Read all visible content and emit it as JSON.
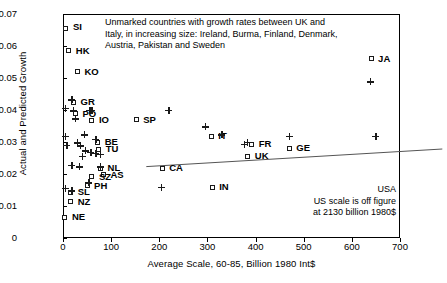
{
  "chart_data": {
    "type": "scatter",
    "title": "",
    "xlabel": "Average Scale, 60-85, Billion 1980 Int$",
    "ylabel": "Actual and Predicted Growth",
    "xlim": [
      0,
      700
    ],
    "ylim": [
      0,
      0.07
    ],
    "xticks": [
      "0",
      "100",
      "200",
      "300",
      "400",
      "500",
      "600",
      "700"
    ],
    "yticks": [
      "0",
      "0.01",
      "0.02",
      "0.03",
      "0.04",
      "0.05",
      "0.06",
      "0.07"
    ],
    "grid": false,
    "legend": "none",
    "series": [
      {
        "name": "Actual growth (open squares)",
        "marker": "open-square",
        "points": [
          {
            "label": "SI",
            "x": 6,
            "y": 0.0655
          },
          {
            "label": "HK",
            "x": 12,
            "y": 0.0585
          },
          {
            "label": "KO",
            "x": 30,
            "y": 0.052
          },
          {
            "label": "GR",
            "x": 22,
            "y": 0.0425
          },
          {
            "label": "PO",
            "x": 26,
            "y": 0.0388
          },
          {
            "label": "IO",
            "x": 60,
            "y": 0.0368
          },
          {
            "label": "SP",
            "x": 152,
            "y": 0.037
          },
          {
            "label": "BE",
            "x": 72,
            "y": 0.03
          },
          {
            "label": "TU",
            "x": 74,
            "y": 0.0278
          },
          {
            "label": "NL",
            "x": 78,
            "y": 0.0218
          },
          {
            "label": "AS",
            "x": 84,
            "y": 0.0198
          },
          {
            "label": "SZ",
            "x": 60,
            "y": 0.0192
          },
          {
            "label": "PH",
            "x": 50,
            "y": 0.0163
          },
          {
            "label": "SL",
            "x": 16,
            "y": 0.0143
          },
          {
            "label": "NZ",
            "x": 16,
            "y": 0.0113
          },
          {
            "label": "NE",
            "x": 4,
            "y": 0.0065
          },
          {
            "label": "CA",
            "x": 206,
            "y": 0.0218
          },
          {
            "label": "IT",
            "x": 308,
            "y": 0.0318
          },
          {
            "label": "FR",
            "x": 392,
            "y": 0.0293
          },
          {
            "label": "UK",
            "x": 384,
            "y": 0.0255
          },
          {
            "label": "GE",
            "x": 470,
            "y": 0.028
          },
          {
            "label": "IN",
            "x": 310,
            "y": 0.0158
          },
          {
            "label": "JA",
            "x": 640,
            "y": 0.056
          }
        ]
      },
      {
        "name": "Predicted growth (plus signs)",
        "marker": "plus",
        "points": [
          {
            "x": 18,
            "y": 0.0432
          },
          {
            "x": 5,
            "y": 0.0405
          },
          {
            "x": 22,
            "y": 0.0398
          },
          {
            "x": 60,
            "y": 0.04
          },
          {
            "x": 26,
            "y": 0.0372
          },
          {
            "x": 5,
            "y": 0.0318
          },
          {
            "x": 44,
            "y": 0.0322
          },
          {
            "x": 68,
            "y": 0.0308
          },
          {
            "x": 30,
            "y": 0.0298
          },
          {
            "x": 8,
            "y": 0.029
          },
          {
            "x": 36,
            "y": 0.0288
          },
          {
            "x": 46,
            "y": 0.0272
          },
          {
            "x": 58,
            "y": 0.0268
          },
          {
            "x": 68,
            "y": 0.0264
          },
          {
            "x": 78,
            "y": 0.0262
          },
          {
            "x": 40,
            "y": 0.0256
          },
          {
            "x": 18,
            "y": 0.0228
          },
          {
            "x": 34,
            "y": 0.0222
          },
          {
            "x": 78,
            "y": 0.0222
          },
          {
            "x": 54,
            "y": 0.0172
          },
          {
            "x": 5,
            "y": 0.0155
          },
          {
            "x": 18,
            "y": 0.0148
          },
          {
            "x": 56,
            "y": 0.04
          },
          {
            "x": 220,
            "y": 0.04
          },
          {
            "x": 330,
            "y": 0.0322
          },
          {
            "x": 295,
            "y": 0.0348
          },
          {
            "x": 383,
            "y": 0.03
          },
          {
            "x": 376,
            "y": 0.0292
          },
          {
            "x": 470,
            "y": 0.0318
          },
          {
            "x": 204,
            "y": 0.0158
          },
          {
            "x": 638,
            "y": 0.0488
          },
          {
            "x": 650,
            "y": 0.0318
          }
        ]
      }
    ],
    "trendline": {
      "x1": 40,
      "y1": 0.027,
      "x2": 655,
      "y2": 0.0325
    },
    "annotations": [
      "Unmarked countries with growth rates between UK and",
      "Italy, in increasing size: Ireland, Burma, Finland, Denmark,",
      "Austria, Pakistan and Sweden",
      "USA",
      "US scale is off figure",
      "at  2130 billion 1980$"
    ]
  },
  "note_main": {
    "line1": "Unmarked countries with growth rates between UK and",
    "line2": "Italy, in increasing size: Ireland, Burma, Finland, Denmark,",
    "line3": "Austria, Pakistan and Sweden"
  },
  "note_us": {
    "line1": "USA",
    "line2": "US scale is off figure",
    "line3": "at  2130 billion 1980$"
  }
}
